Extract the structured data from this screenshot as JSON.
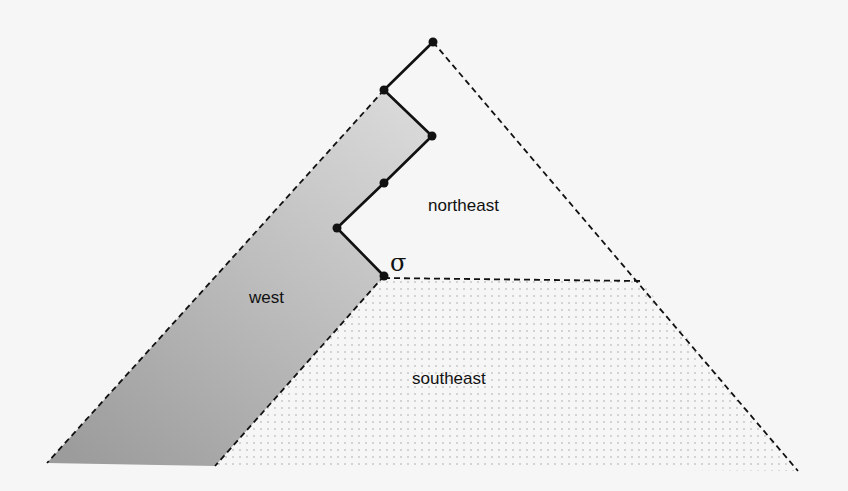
{
  "diagram": {
    "regions": {
      "west": "west",
      "northeast": "northeast",
      "southeast": "southeast"
    },
    "sigma_label": "σ",
    "path_points": [
      [
        433,
        42
      ],
      [
        384,
        90
      ],
      [
        432,
        136
      ],
      [
        384,
        183
      ],
      [
        337,
        228
      ],
      [
        384,
        276
      ]
    ],
    "colors": {
      "line": "#111111",
      "west_light": "#d6d6d6",
      "west_dark": "#9a9a9a",
      "dots": "#a8a8a8",
      "background": "#f6f6f6"
    }
  }
}
